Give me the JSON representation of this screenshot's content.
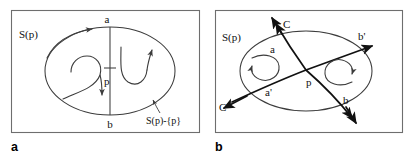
{
  "figure": {
    "background_color": "#ffffff",
    "frame_color": "#6e6e6e",
    "curve_color": "#3c3c3c",
    "bold_curve_color": "#111111"
  },
  "panel_a": {
    "letter": "a",
    "labels": {
      "set_label": "S(p)",
      "top_point": "a",
      "bottom_point": "b",
      "center_point": "p",
      "punctured_set": "S(p)-{p}"
    }
  },
  "panel_b": {
    "letter": "b",
    "labels": {
      "set_label": "S(p)",
      "curve_c": "C",
      "curve_c_prime": "C'",
      "point_a": "a",
      "point_a_prime": "a'",
      "point_b": "b",
      "point_b_prime": "b'",
      "center_point": "p"
    }
  }
}
